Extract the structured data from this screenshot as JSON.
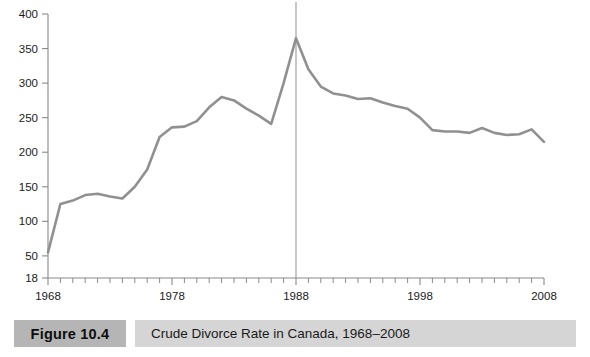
{
  "figure": {
    "number_label": "Figure 10.4",
    "caption": "Crude Divorce Rate in Canada, 1968–2008"
  },
  "chart_data": {
    "type": "line",
    "title": "Crude Divorce Rate in Canada, 1968–2008",
    "xlabel": "",
    "ylabel": "",
    "xlim": [
      1968,
      2008
    ],
    "ylim": [
      18,
      400
    ],
    "grid": false,
    "legend": null,
    "y_ticks": [
      18,
      50,
      100,
      150,
      200,
      250,
      300,
      350,
      400
    ],
    "y_tick_labels": [
      "18",
      "50",
      "100",
      "150",
      "200",
      "250",
      "300",
      "350",
      "400"
    ],
    "x_ticks": [
      1968,
      1978,
      1988,
      1998,
      2008
    ],
    "x_tick_labels": [
      "1968",
      "1978",
      "1988",
      "1998",
      "2008"
    ],
    "x_minor_tick_interval": 1,
    "annotations": [
      {
        "type": "vertical-reference-line",
        "x": 1988,
        "label": ""
      }
    ],
    "line_color": "#909090",
    "axis_color": "#8a8a8a",
    "x": [
      1968,
      1969,
      1970,
      1971,
      1972,
      1973,
      1974,
      1975,
      1976,
      1977,
      1978,
      1979,
      1980,
      1981,
      1982,
      1983,
      1984,
      1985,
      1986,
      1987,
      1988,
      1989,
      1990,
      1991,
      1992,
      1993,
      1994,
      1995,
      1996,
      1997,
      1998,
      1999,
      2000,
      2001,
      2002,
      2003,
      2004,
      2005,
      2006,
      2007,
      2008
    ],
    "values": [
      55,
      125,
      130,
      138,
      140,
      136,
      133,
      150,
      175,
      222,
      236,
      237,
      245,
      265,
      280,
      275,
      263,
      253,
      241,
      300,
      365,
      320,
      295,
      285,
      282,
      277,
      278,
      272,
      267,
      263,
      250,
      232,
      230,
      230,
      228,
      235,
      228,
      225,
      226,
      233,
      215
    ]
  }
}
